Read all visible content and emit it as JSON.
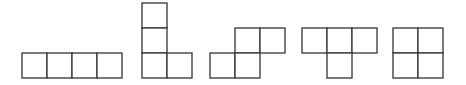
{
  "diagram": {
    "cell_size": 25,
    "stroke_color": "#333333",
    "fill_color": "#ffffff",
    "pieces": [
      {
        "name": "I",
        "cells": [
          [
            22,
            53
          ],
          [
            47,
            53
          ],
          [
            72,
            53
          ],
          [
            97,
            53
          ]
        ]
      },
      {
        "name": "L",
        "cells": [
          [
            142,
            3
          ],
          [
            142,
            28
          ],
          [
            142,
            53
          ],
          [
            167,
            53
          ]
        ]
      },
      {
        "name": "S",
        "cells": [
          [
            235,
            28
          ],
          [
            260,
            28
          ],
          [
            210,
            53
          ],
          [
            235,
            53
          ]
        ]
      },
      {
        "name": "T",
        "cells": [
          [
            302,
            28
          ],
          [
            327,
            28
          ],
          [
            352,
            28
          ],
          [
            327,
            53
          ]
        ]
      },
      {
        "name": "O",
        "cells": [
          [
            393,
            28
          ],
          [
            418,
            28
          ],
          [
            393,
            53
          ],
          [
            418,
            53
          ]
        ]
      }
    ]
  }
}
